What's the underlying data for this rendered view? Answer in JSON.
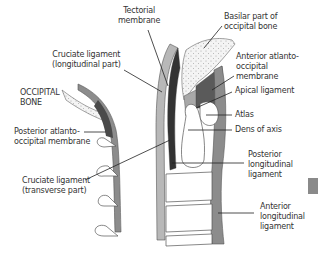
{
  "figure": {
    "type": "anatomical diagram"
  },
  "labels": {
    "tectorial_membrane": "Tectorial\nmembrane",
    "basilar_part": "Basilar part of\noccipital bone",
    "cruciate_longitudinal": "Cruciate ligament\n(longitudinal part)",
    "anterior_atlanto_occipital": "Anterior atlanto-\noccipital\nmembrane",
    "occipital_bone": "OCCIPITAL\nBONE",
    "apical_ligament": "Apical ligament",
    "atlas": "Atlas",
    "posterior_atlanto_occipital": "Posterior atlanto-\noccipital membrane",
    "dens_of_axis": "Dens of axis",
    "posterior_longitudinal": "Posterior\nlongitudinal\nligament",
    "cruciate_transverse": "Cruciate ligament\n(transverse part)",
    "anterior_longitudinal": "Anterior\nlongitudinal\nligament"
  },
  "colors": {
    "background": "#ffffff",
    "ligament_light": "#b8b8b8",
    "ligament_mid": "#8c8c8c",
    "ligament_dark": "#3a3a3a",
    "membrane_dark": "#5a5a5a",
    "bone_fill": "#ffffff",
    "outline": "#555555",
    "leader_line": "#222222",
    "side_tab": "#8a8a8a"
  }
}
